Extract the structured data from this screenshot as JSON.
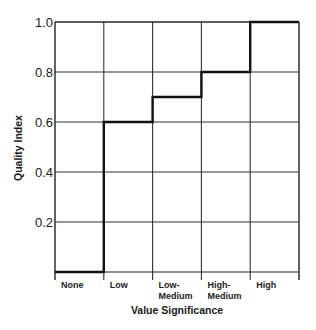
{
  "chart_data": {
    "type": "line",
    "subtype": "step",
    "title": "",
    "xlabel": "Value Significance",
    "ylabel": "Quality Index",
    "categories": [
      [
        "None"
      ],
      [
        "Low"
      ],
      [
        "Low-",
        "Medium"
      ],
      [
        "High-",
        "Medium"
      ],
      [
        "High"
      ]
    ],
    "category_names": [
      "None",
      "Low",
      "Low-Medium",
      "High-Medium",
      "High"
    ],
    "values": [
      0.0,
      0.6,
      0.7,
      0.8,
      1.0
    ],
    "ylim": [
      0,
      1.0
    ],
    "yticks": [
      0.2,
      0.4,
      0.6,
      0.8,
      1.0
    ],
    "ytick_labels": [
      "0.2",
      "0.4",
      "0.6",
      "0.8",
      "1.0"
    ],
    "grid": true,
    "legend": null,
    "line_color": "#111111",
    "grid_color": "#333333"
  }
}
